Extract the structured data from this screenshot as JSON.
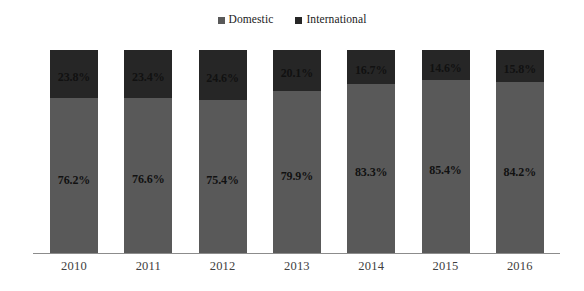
{
  "chart_data": {
    "type": "bar",
    "subtype": "stacked-100-percent",
    "title": "",
    "subtitle": "",
    "xlabel": "",
    "ylabel": "",
    "ylim": [
      0,
      100
    ],
    "grid": false,
    "legend_position": "top-center",
    "categories": [
      "2010",
      "2011",
      "2012",
      "2013",
      "2014",
      "2015",
      "2016"
    ],
    "series": [
      {
        "name": "Domestic",
        "color": "#595959",
        "values": [
          76.2,
          76.6,
          75.4,
          79.9,
          83.3,
          85.4,
          84.2
        ],
        "labels": [
          "76.2%",
          "76.6%",
          "75.4%",
          "79.9%",
          "83.3%",
          "85.4%",
          "84.2%"
        ]
      },
      {
        "name": "International",
        "color": "#262626",
        "values": [
          23.8,
          23.4,
          24.6,
          20.1,
          16.7,
          14.6,
          15.8
        ],
        "labels": [
          "23.8%",
          "23.4%",
          "24.6%",
          "20.1%",
          "16.7%",
          "14.6%",
          "15.8%"
        ]
      }
    ]
  },
  "legend": {
    "items": [
      {
        "label": "Domestic",
        "color": "#595959"
      },
      {
        "label": "International",
        "color": "#262626"
      }
    ]
  },
  "axis": {
    "x_tick_labels": [
      "2010",
      "2011",
      "2012",
      "2013",
      "2014",
      "2015",
      "2016"
    ]
  },
  "colors": {
    "background": "#ffffff",
    "domestic": "#595959",
    "international": "#262626",
    "axis_line": "#8c8c8c",
    "tick_text": "#404040",
    "value_text": "#111111"
  }
}
